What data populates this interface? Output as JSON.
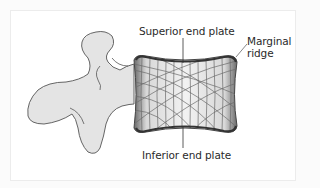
{
  "diagram": {
    "labels": {
      "superior_end_plate": "Superior end plate",
      "marginal_ridge_line1": "Marginal",
      "marginal_ridge_line2": "ridge",
      "inferior_end_plate": "Inferior end plate"
    },
    "colors": {
      "bone_fill": "#e4e4e4",
      "outline": "#555555",
      "trabecular_lines": "#6a6a6a",
      "end_plate": "#3a3a3a",
      "text": "#2a2a2a",
      "background": "#ffffff"
    }
  }
}
